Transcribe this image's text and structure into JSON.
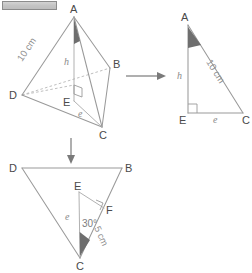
{
  "figure": {
    "title_bar": "",
    "tetrahedron": {
      "vertices": {
        "A": "A",
        "B": "B",
        "C": "C",
        "D": "D",
        "E": "E"
      },
      "labels": {
        "slant_edge": "10 cm",
        "height": "h",
        "base_segment": "e"
      }
    },
    "right_triangle": {
      "vertices": {
        "A": "A",
        "E": "E",
        "C": "C"
      },
      "labels": {
        "hypotenuse": "10 cm",
        "height": "h",
        "base": "e"
      }
    },
    "base_triangle": {
      "vertices": {
        "D": "D",
        "B": "B",
        "C": "C",
        "E": "E",
        "F": "F"
      },
      "labels": {
        "segment_ec": "e",
        "angle": "30°",
        "side": "5 cm"
      }
    },
    "arrows": {
      "to_right_triangle": "arrow-right",
      "to_base_triangle": "arrow-down"
    },
    "colors": {
      "line": "#9a9a9a",
      "shade": "#6e6e6e",
      "text": "#4a4a4a",
      "dim_text": "#8f8f8f"
    }
  }
}
